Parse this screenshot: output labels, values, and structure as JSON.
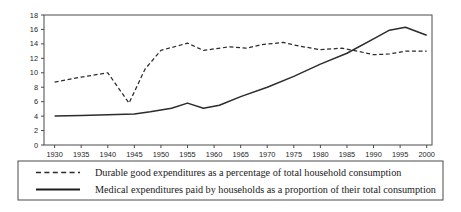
{
  "chart_data": {
    "type": "line",
    "title": "",
    "xlabel": "",
    "ylabel": "",
    "xlim": [
      1928,
      2001
    ],
    "ylim": [
      0,
      18
    ],
    "grid": false,
    "legend_position": "bottom",
    "x_ticks": [
      1930,
      1935,
      1940,
      1945,
      1950,
      1955,
      1960,
      1965,
      1970,
      1975,
      1980,
      1985,
      1990,
      1995,
      2000
    ],
    "y_ticks": [
      0,
      2,
      4,
      6,
      8,
      10,
      12,
      14,
      16,
      18
    ],
    "series": [
      {
        "name": "Durable good expenditures as a percentage of total household consumption",
        "style": "dashed",
        "color": "#2b2b2b",
        "x": [
          1930,
          1935,
          1940,
          1944,
          1947,
          1950,
          1955,
          1958,
          1960,
          1963,
          1966,
          1969,
          1973,
          1976,
          1980,
          1984,
          1987,
          1990,
          1993,
          1996,
          2000
        ],
        "values": [
          8.7,
          9.4,
          10.0,
          5.8,
          10.5,
          13.1,
          14.1,
          13.1,
          13.3,
          13.6,
          13.4,
          13.9,
          14.2,
          13.7,
          13.2,
          13.4,
          13.0,
          12.5,
          12.6,
          13.0,
          13.0
        ]
      },
      {
        "name": "Medical expenditures paid by households as a proportion of their total consumption",
        "style": "solid",
        "color": "#2b2b2b",
        "x": [
          1930,
          1935,
          1940,
          1945,
          1948,
          1952,
          1955,
          1958,
          1961,
          1965,
          1970,
          1975,
          1980,
          1985,
          1990,
          1993,
          1996,
          2000
        ],
        "values": [
          4.0,
          4.1,
          4.2,
          4.3,
          4.6,
          5.1,
          5.8,
          5.1,
          5.5,
          6.7,
          8.0,
          9.5,
          11.2,
          12.7,
          14.7,
          15.9,
          16.3,
          15.2
        ]
      }
    ]
  },
  "legend": {
    "entries": [
      {
        "swatch": "dashed-line-swatch",
        "label": "Durable good expenditures as a percentage of total household consumption"
      },
      {
        "swatch": "solid-line-swatch",
        "label": "Medical expenditures paid by households as a proportion of their total consumption"
      }
    ]
  }
}
